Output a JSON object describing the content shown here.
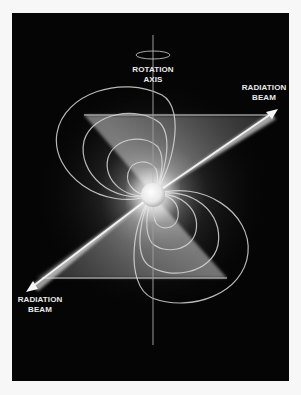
{
  "diagram": {
    "labels": {
      "rotation_axis": {
        "line1": "ROTATION",
        "line2": "AXIS"
      },
      "radiation_beam_top": {
        "line1": "RADIATION",
        "line2": "BEAM"
      },
      "radiation_beam_bottom": {
        "line1": "RADIATION",
        "line2": "BEAM"
      }
    },
    "elements": [
      "neutron-star",
      "rotation-axis",
      "rotation-direction-ellipse",
      "magnetic-field-lines",
      "radiation-beam-upper-right",
      "radiation-beam-lower-left"
    ],
    "colors": {
      "background": "#050505",
      "page": "#f7f7f7",
      "foreground": "#e9e9e9"
    }
  }
}
